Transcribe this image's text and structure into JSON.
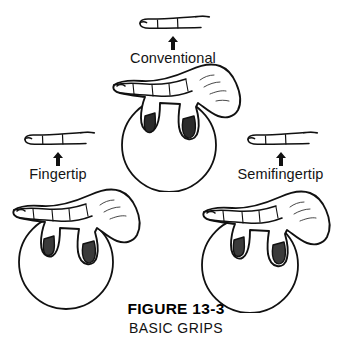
{
  "figure": {
    "number": "FIGURE 13-3",
    "title": "BASIC GRIPS",
    "background_color": "#ffffff",
    "ink_color": "#111111"
  },
  "grips": [
    {
      "id": "conventional",
      "label": "Conventional",
      "icon_name": "finger-profile-icon",
      "arrow_name": "up-arrow-icon",
      "ball_name": "bowling-ball-outline",
      "hand_name": "hand-gripping-ball"
    },
    {
      "id": "fingertip",
      "label": "Fingertip",
      "icon_name": "finger-profile-icon",
      "arrow_name": "up-arrow-icon",
      "ball_name": "bowling-ball-outline",
      "hand_name": "hand-gripping-ball"
    },
    {
      "id": "semifingertip",
      "label": "Semifingertip",
      "icon_name": "finger-profile-icon",
      "arrow_name": "up-arrow-icon",
      "ball_name": "bowling-ball-outline",
      "hand_name": "hand-gripping-ball"
    }
  ]
}
